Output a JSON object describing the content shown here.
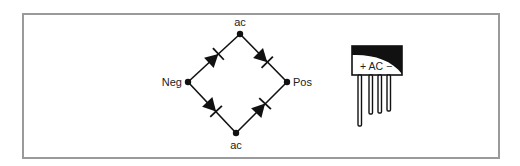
{
  "diagram": {
    "bridge": {
      "top_label": "ac",
      "bottom_label": "ac",
      "left_label": "Neg",
      "right_label": "Pos"
    },
    "package": {
      "marking": "+ AC −"
    }
  }
}
